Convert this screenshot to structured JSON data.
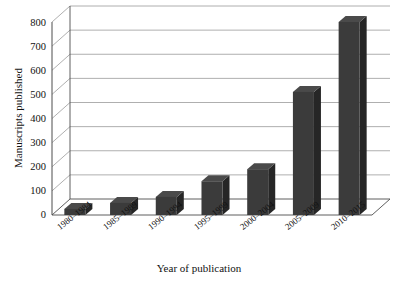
{
  "chart_data": {
    "type": "bar",
    "title": "Frequency of radiochromic film publications",
    "xlabel": "Year of publication",
    "ylabel": "Manuscripts published",
    "categories": [
      "1980–1984",
      "1985–1989",
      "1990–1994",
      "1995–1999",
      "2000–2004",
      "2005–2009",
      "2010–2015"
    ],
    "values": [
      25,
      50,
      75,
      140,
      190,
      510,
      800
    ],
    "ylim": [
      0,
      800
    ],
    "yticks": [
      0,
      100,
      200,
      300,
      400,
      500,
      600,
      700,
      800
    ],
    "ytick_labels": [
      "0",
      "100",
      "200",
      "300",
      "400",
      "500",
      "600",
      "700",
      "800"
    ],
    "grid": true,
    "legend": false,
    "style": "3d-column",
    "bar_color": "#3b3b3b",
    "bar_side_color": "#262626",
    "bar_top_color": "#4a4a4a",
    "grid_color": "#9a9a9a",
    "axis_color": "#4d4d4d",
    "background": "#ffffff"
  }
}
